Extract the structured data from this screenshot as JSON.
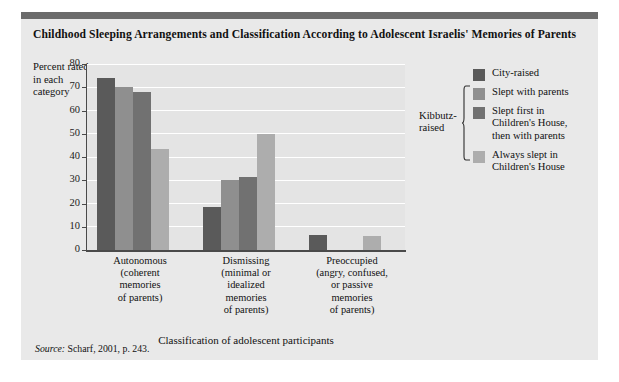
{
  "figure": {
    "title": "Childhood Sleeping Arrangements and Classification According to Adolescent Israelis' Memories of Parents",
    "source_label": "Source:",
    "source_text": " Scharf, 2001, p. 243.",
    "kibbutz_bracket_label": "Kibbutz-\nraised"
  },
  "chart_data": {
    "type": "bar",
    "title": "Childhood Sleeping Arrangements and Classification According to Adolescent Israelis' Memories of Parents",
    "xlabel": "Classification of adolescent participants",
    "ylabel": "Percent rated in each category",
    "ylim": [
      0,
      80
    ],
    "yticks": [
      0,
      10,
      20,
      30,
      40,
      50,
      60,
      70,
      80
    ],
    "grid": true,
    "legend_position": "right",
    "categories": [
      "Autonomous (coherent memories of parents)",
      "Dismissing (minimal or idealized memories of parents)",
      "Preoccupied (angry, confused, or passive memories of parents)"
    ],
    "category_lines": [
      [
        "Autonomous",
        "(coherent",
        "memories",
        "of parents)"
      ],
      [
        "Dismissing",
        "(minimal or",
        "idealized",
        "memories",
        "of parents)"
      ],
      [
        "Preoccupied",
        "(angry, confused,",
        "or passive",
        "memories",
        "of parents)"
      ]
    ],
    "series": [
      {
        "name": "City-raised",
        "color": "#5a5a5a",
        "values": [
          74,
          18.5,
          6.5
        ]
      },
      {
        "name": "Slept with parents",
        "color": "#8f8f8f",
        "values": [
          70,
          30,
          0
        ]
      },
      {
        "name": "Slept first in Children's House, then with parents",
        "color": "#717171",
        "values": [
          68,
          31.5,
          0
        ]
      },
      {
        "name": "Always slept in Children's House",
        "color": "#adadad",
        "values": [
          43.5,
          50,
          6
        ]
      }
    ]
  },
  "legend": {
    "items": [
      {
        "label_lines": [
          "City-raised"
        ],
        "color": "#5a5a5a"
      },
      {
        "label_lines": [
          "Slept with parents"
        ],
        "color": "#8f8f8f"
      },
      {
        "label_lines": [
          "Slept first in",
          "Children's House,",
          "then with parents"
        ],
        "color": "#717171"
      },
      {
        "label_lines": [
          "Always slept in",
          "Children's House"
        ],
        "color": "#adadad"
      }
    ]
  },
  "colors": {
    "figure_bg": "#e9e9e9",
    "plot_bg": "#e4e4e4",
    "gridline": "#ffffff",
    "axis": "#4a4a4a",
    "top_rule": "#6b6b6b",
    "text": "#111111"
  }
}
